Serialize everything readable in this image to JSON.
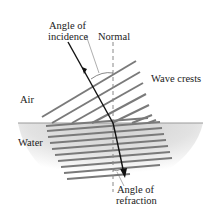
{
  "diagram": {
    "labels": {
      "angle_incidence_line1": "Angle of",
      "angle_incidence_line2": "incidence",
      "normal": "Normal",
      "wave_crests": "Wave crests",
      "air": "Air",
      "water": "Water",
      "angle_refraction_line1": "Angle of",
      "angle_refraction_line2": "refraction"
    },
    "colors": {
      "crest": "#7a7a7a",
      "ray": "#111111",
      "normal": "#888888",
      "surface": "#9a9a9a",
      "water_shade": "#d4d4d4"
    },
    "air_crest_count": 7,
    "water_crest_count": 10
  }
}
